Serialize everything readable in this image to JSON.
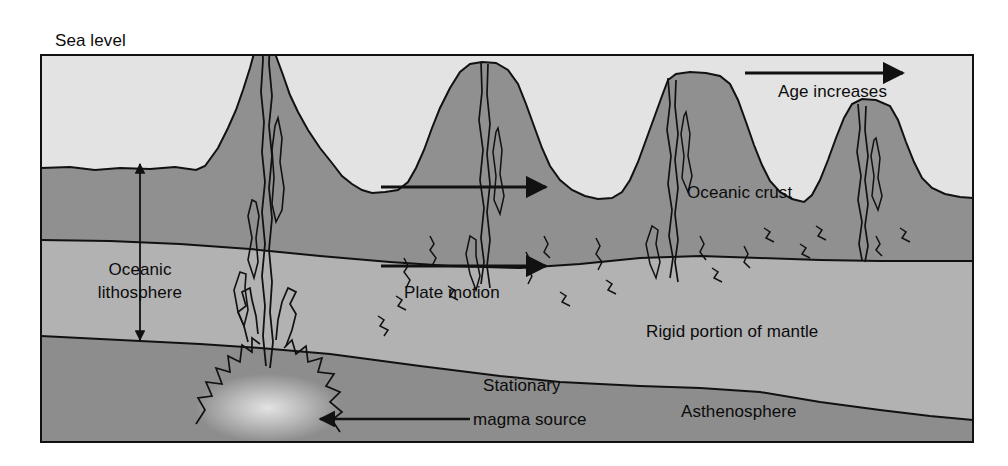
{
  "figure": {
    "frame": {
      "x": 41,
      "y": 55,
      "width": 932,
      "height": 387
    }
  },
  "labels": {
    "sea_level": "Sea level",
    "age_increases": "Age increases",
    "oceanic_crust": "Oceanic crust",
    "oceanic_lithosphere_line1": "Oceanic",
    "oceanic_lithosphere_line2": "lithosphere",
    "plate_motion": "Plate motion",
    "rigid_portion_of_mantle": "Rigid portion of mantle",
    "stationary_line1": "Stationary",
    "stationary_line2": "magma source",
    "asthenosphere": "Asthenosphere"
  },
  "colors": {
    "page_background": "#ffffff",
    "water": "#e3e3e3",
    "crust": "#909090",
    "rigid_mantle": "#b0b0b0",
    "asthenosphere": "#8e8e8e",
    "outline": "#111111",
    "text": "#0b0b0b",
    "magma_glow": "#d8d8d8"
  },
  "arrows": [
    {
      "name": "age-increases-arrow",
      "label": "Age increases",
      "direction": "right",
      "x1": 745,
      "y1": 73,
      "x2": 905,
      "y2": 73
    },
    {
      "name": "plate-motion-arrow-upper",
      "label": "Plate motion",
      "direction": "right",
      "x1": 381,
      "y1": 187,
      "x2": 548,
      "y2": 187
    },
    {
      "name": "plate-motion-arrow-lower",
      "label": "Plate motion",
      "direction": "right",
      "x1": 381,
      "y1": 266,
      "x2": 548,
      "y2": 266
    },
    {
      "name": "oceanic-lithosphere-arrow",
      "label": "Oceanic lithosphere",
      "direction": "vertical-double",
      "x1": 140,
      "y1": 162,
      "x2": 140,
      "y2": 340
    },
    {
      "name": "magma-source-arrow",
      "label": "Stationary magma source",
      "direction": "left",
      "x1": 470,
      "y1": 419,
      "x2": 318,
      "y2": 419
    }
  ],
  "layers": [
    {
      "name": "water",
      "label": "Sea water",
      "depth_top": 55,
      "depth_bottom": 170
    },
    {
      "name": "oceanic-crust",
      "label": "Oceanic crust",
      "depth_top": 160,
      "depth_bottom": 240
    },
    {
      "name": "rigid-mantle",
      "label": "Rigid portion of mantle",
      "depth_top": 240,
      "depth_bottom": 355
    },
    {
      "name": "asthenosphere",
      "label": "Asthenosphere",
      "depth_top": 355,
      "depth_bottom": 442
    }
  ],
  "volcanoes": [
    {
      "name": "ridge-volcano-active",
      "peak_x": 262,
      "peak_y": 29,
      "age_order": 1,
      "above_sea_level": true
    },
    {
      "name": "seamount-2",
      "peak_x": 482,
      "peak_y": 62,
      "age_order": 2,
      "above_sea_level": false
    },
    {
      "name": "seamount-3",
      "peak_x": 668,
      "peak_y": 73,
      "age_order": 3,
      "above_sea_level": false
    },
    {
      "name": "seamount-4",
      "peak_x": 858,
      "peak_y": 100,
      "age_order": 4,
      "above_sea_level": false
    }
  ]
}
